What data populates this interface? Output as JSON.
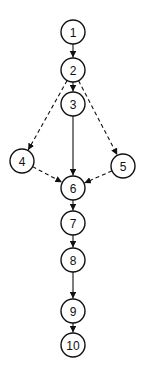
{
  "diagram": {
    "type": "control-flow-graph",
    "nodes": [
      {
        "id": "1",
        "label": "1",
        "x": 73,
        "y": 32
      },
      {
        "id": "2",
        "label": "2",
        "x": 73,
        "y": 70
      },
      {
        "id": "3",
        "label": "3",
        "x": 73,
        "y": 104
      },
      {
        "id": "4",
        "label": "4",
        "x": 22,
        "y": 161
      },
      {
        "id": "5",
        "label": "5",
        "x": 123,
        "y": 166
      },
      {
        "id": "6",
        "label": "6",
        "x": 73,
        "y": 188
      },
      {
        "id": "7",
        "label": "7",
        "x": 73,
        "y": 223
      },
      {
        "id": "8",
        "label": "8",
        "x": 73,
        "y": 260
      },
      {
        "id": "9",
        "label": "9",
        "x": 73,
        "y": 311
      },
      {
        "id": "10",
        "label": "10",
        "x": 73,
        "y": 345
      }
    ],
    "edges": [
      {
        "from": "1",
        "to": "2",
        "style": "solid"
      },
      {
        "from": "2",
        "to": "3",
        "style": "solid"
      },
      {
        "from": "2",
        "to": "4",
        "style": "dashed"
      },
      {
        "from": "2",
        "to": "5",
        "style": "dashed"
      },
      {
        "from": "3",
        "to": "6",
        "style": "solid"
      },
      {
        "from": "4",
        "to": "6",
        "style": "dashed"
      },
      {
        "from": "5",
        "to": "6",
        "style": "dashed"
      },
      {
        "from": "6",
        "to": "7",
        "style": "solid"
      },
      {
        "from": "7",
        "to": "8",
        "style": "solid"
      },
      {
        "from": "8",
        "to": "9",
        "style": "solid"
      },
      {
        "from": "9",
        "to": "10",
        "style": "solid"
      }
    ],
    "node_radius": 12,
    "colors": {
      "stroke": "#111111",
      "fill": "#ffffff",
      "background": "#ffffff"
    }
  }
}
